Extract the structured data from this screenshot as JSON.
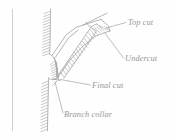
{
  "figure": {
    "kind": "line-drawing",
    "ink_color": "#9a9a9e",
    "hatch_color": "#a8a8ac",
    "background_color": "#fefefe",
    "label_color": "#8e8e92",
    "labels": [
      {
        "id": "top-cut",
        "text": "Top cut"
      },
      {
        "id": "undercut",
        "text": "Undercut"
      },
      {
        "id": "final-cut",
        "text": "Final cut"
      },
      {
        "id": "branch-collar",
        "text": "Branch collar"
      }
    ],
    "parts": [
      {
        "id": "margin-rule",
        "name": "left margin rule"
      },
      {
        "id": "trunk",
        "name": "trunk with hatched bark"
      },
      {
        "id": "branch",
        "name": "branch limb"
      },
      {
        "id": "cut-face",
        "name": "hatched cut face"
      },
      {
        "id": "collar",
        "name": "branch collar hatching"
      }
    ]
  }
}
